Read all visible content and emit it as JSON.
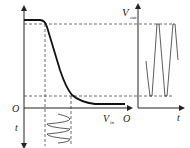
{
  "diagram": {
    "type": "transfer-characteristic",
    "labels": {
      "origin_left": "O",
      "time_down": "t",
      "vout_main": "V",
      "vout_sub": "out",
      "vin_main": "V",
      "vin_sub": "in",
      "origin_right": "O",
      "time_right": "t"
    },
    "colors": {
      "line": "#222222",
      "dashed": "#444444"
    },
    "transfer_curve": "high plateau then steep drop then low tail",
    "input_signal": "sinusoid along vertical time axis between dashed guides",
    "output_signal": "amplified waveform clipped between upper and lower dashed levels"
  }
}
